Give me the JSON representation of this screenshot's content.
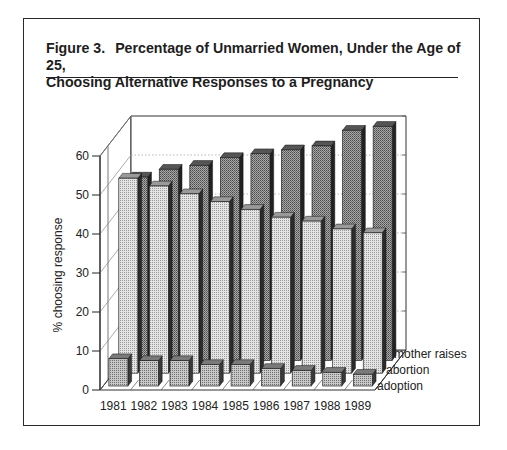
{
  "figure": {
    "number": "Figure 3.",
    "title_line1": "Percentage of Unmarried Women, Under the Age of 25,",
    "title_line2": "Choosing Alternative Responses to a Pregnancy"
  },
  "chart_data": {
    "type": "bar",
    "style": "3d-grouped-depth",
    "xlabel": "",
    "ylabel": "% choosing response",
    "ylim": [
      0,
      60
    ],
    "yticks": [
      0,
      10,
      20,
      30,
      40,
      50,
      60
    ],
    "categories": [
      "1981",
      "1982",
      "1983",
      "1984",
      "1985",
      "1986",
      "1987",
      "1988",
      "1989"
    ],
    "series": [
      {
        "name": "adoption",
        "depth_row": 0,
        "color": "#bdbdbd",
        "values": [
          7,
          6.5,
          6.5,
          5.5,
          5.5,
          4.5,
          4,
          3.5,
          3
        ]
      },
      {
        "name": "abortion",
        "depth_row": 1,
        "color": "#d6d6d6",
        "values": [
          50,
          48,
          46,
          44,
          42,
          40,
          39,
          37,
          36
        ]
      },
      {
        "name": "mother raises",
        "depth_row": 2,
        "color": "#8f8f8f",
        "values": [
          47,
          49,
          50,
          52,
          53,
          54,
          55,
          59,
          60
        ]
      }
    ],
    "legend": [
      "mother raises",
      "abortion",
      "adoption"
    ],
    "legend_position": "right, along depth axis",
    "grid": true
  }
}
